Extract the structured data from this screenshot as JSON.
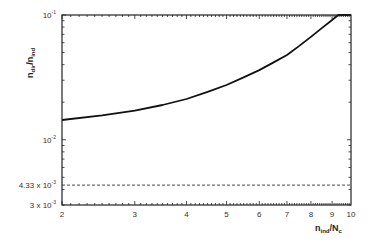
{
  "chart_data": {
    "type": "line",
    "title": "",
    "xlabel": {
      "main": "n",
      "sub": "ind",
      "rest": "/N",
      "rest_sub": "c"
    },
    "ylabel": {
      "main": "n",
      "sub": "dir",
      "rest": "/n",
      "rest_sub": "ind"
    },
    "xscale": "log",
    "yscale": "log",
    "xlim": [
      2,
      10
    ],
    "ylim": [
      0.003,
      0.1
    ],
    "grid": false,
    "x_ticks": [
      {
        "value": 2,
        "label": "2"
      },
      {
        "value": 3,
        "label": "3"
      },
      {
        "value": 4,
        "label": "4"
      },
      {
        "value": 5,
        "label": "5"
      },
      {
        "value": 6,
        "label": "6"
      },
      {
        "value": 7,
        "label": "7"
      },
      {
        "value": 8,
        "label": "8"
      },
      {
        "value": 9,
        "label": "9"
      },
      {
        "value": 10,
        "label": "10"
      }
    ],
    "y_ticks": [
      {
        "value": 0.1,
        "base": "10",
        "exp": "-1",
        "prefix": ""
      },
      {
        "value": 0.01,
        "base": "10",
        "exp": "-2",
        "prefix": ""
      },
      {
        "value": 0.00433,
        "base": "10",
        "exp": "-3",
        "prefix": "4.33 x "
      },
      {
        "value": 0.003,
        "base": "10",
        "exp": "-3",
        "prefix": "3 x "
      }
    ],
    "series": [
      {
        "name": "n_dir/n_ind",
        "style": "solid",
        "color": "#111111",
        "x": [
          2,
          2.5,
          3,
          3.5,
          4,
          4.5,
          5,
          5.5,
          6,
          6.5,
          7,
          7.5,
          8,
          8.5,
          9,
          9.31,
          10
        ],
        "y": [
          0.0144,
          0.0157,
          0.0171,
          0.019,
          0.0212,
          0.0242,
          0.0275,
          0.0316,
          0.0362,
          0.0417,
          0.0478,
          0.0565,
          0.0667,
          0.0785,
          0.0912,
          0.1,
          0.1
        ]
      },
      {
        "name": "threshold",
        "style": "dashed",
        "color": "#333333",
        "x": [
          2,
          10
        ],
        "y": [
          0.00433,
          0.00433
        ]
      }
    ]
  }
}
